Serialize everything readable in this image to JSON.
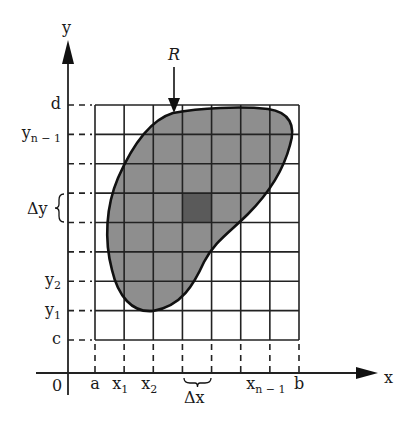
{
  "diagram": {
    "type": "double-integral-region-partition",
    "region_label": "R",
    "axis_labels": {
      "x": "x",
      "y": "y",
      "origin": "0"
    },
    "x_ticks": [
      {
        "label": "a",
        "sub": ""
      },
      {
        "label": "x",
        "sub": "1"
      },
      {
        "label": "x",
        "sub": "2"
      },
      {
        "label": "",
        "sub": ""
      },
      {
        "label": "",
        "sub": ""
      },
      {
        "label": "",
        "sub": ""
      },
      {
        "label": "x",
        "sub": "n − 1"
      },
      {
        "label": "b",
        "sub": ""
      }
    ],
    "y_ticks": [
      {
        "label": "c",
        "sub": ""
      },
      {
        "label": "y",
        "sub": "1"
      },
      {
        "label": "y",
        "sub": "2"
      },
      {
        "label": "",
        "sub": ""
      },
      {
        "label": "",
        "sub": ""
      },
      {
        "label": "",
        "sub": ""
      },
      {
        "label": "",
        "sub": ""
      },
      {
        "label": "y",
        "sub": "n − 1"
      },
      {
        "label": "d",
        "sub": ""
      }
    ],
    "delta_x_label": "Δx",
    "delta_y_label": "Δy",
    "grid": {
      "columns": 7,
      "rows": 8
    },
    "highlighted_cell": {
      "column": 4,
      "row": 5
    },
    "colors": {
      "region_fill": "#8e8e8e",
      "highlight_fill": "#5a5a5a",
      "line": "#222222",
      "background": "#ffffff"
    }
  }
}
